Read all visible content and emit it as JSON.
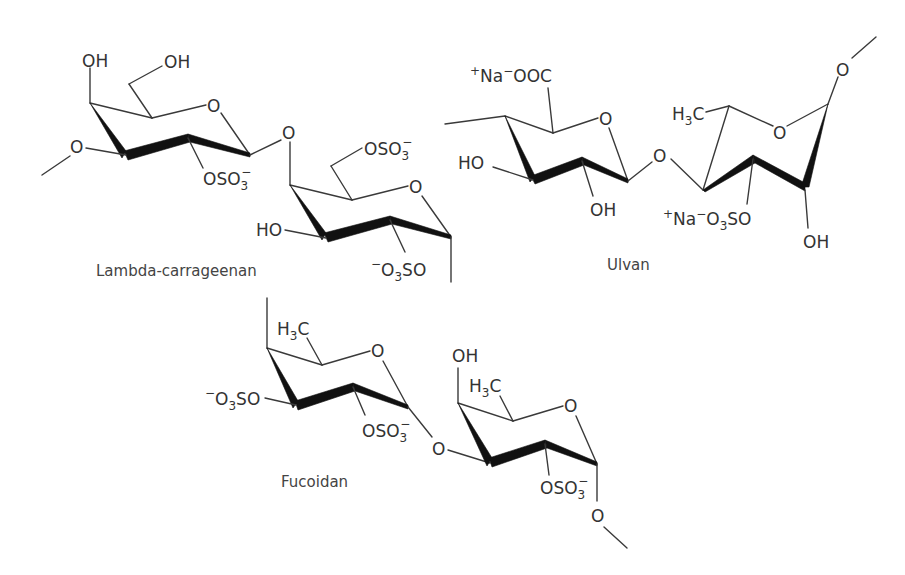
{
  "figure": {
    "structures": [
      {
        "name": "Lambda-carrageenan",
        "caption": "Lambda-carrageenan",
        "labels": [
          "OH",
          "OH",
          "O",
          "O",
          "OSO3-",
          "O",
          "OSO3-",
          "O",
          "HO",
          "-O3SO"
        ]
      },
      {
        "name": "Ulvan",
        "caption": "Ulvan",
        "labels": [
          "+Na-OOC",
          "O",
          "HO",
          "OH",
          "O",
          "H3C",
          "O",
          "+Na-O3SO",
          "OH",
          "O"
        ]
      },
      {
        "name": "Fucoidan",
        "caption": "Fucoidan",
        "labels": [
          "H3C",
          "O",
          "-O3SO",
          "OSO3-",
          "O",
          "OH",
          "H3C",
          "O",
          "OSO3-",
          "O"
        ]
      }
    ]
  },
  "captions": {
    "lambda": "Lambda-carrageenan",
    "ulvan": "Ulvan",
    "fucoidan": "Fucoidan"
  },
  "atoms": {
    "O": "O",
    "OH": "OH",
    "HO": "HO",
    "H": "H",
    "C": "C",
    "S": "S",
    "Na": "Na",
    "OSO": "OSO",
    "OOC": "OOC",
    "SO": "SO",
    "sub3": "3",
    "plus": "+",
    "minus": "−"
  }
}
